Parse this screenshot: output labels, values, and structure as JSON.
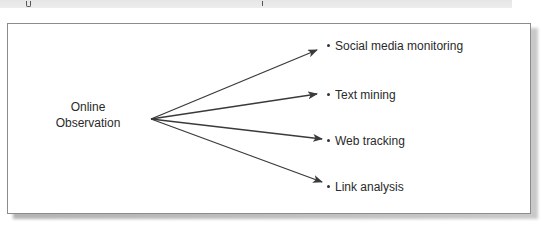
{
  "diagram": {
    "source": {
      "line1": "Online",
      "line2": "Observation"
    },
    "targets": [
      {
        "label": "Social media monitoring"
      },
      {
        "label": "Text mining"
      },
      {
        "label": "Web tracking"
      },
      {
        "label": "Link analysis"
      }
    ],
    "colors": {
      "arrow": "#3a3a3a",
      "border": "#8c8c8c",
      "text": "#2a2a2a",
      "shadow": "#a8a8a8",
      "caption_band": "#e8e8e8"
    }
  }
}
